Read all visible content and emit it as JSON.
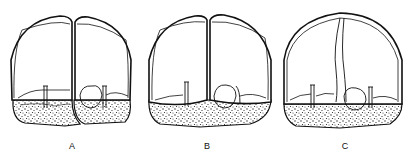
{
  "figure": {
    "panels": [
      {
        "id": "A",
        "label": "A",
        "label_x": 72,
        "label_y": 141
      },
      {
        "id": "B",
        "label": "B",
        "label_x": 207,
        "label_y": 141
      },
      {
        "id": "C",
        "label": "C",
        "label_x": 345,
        "label_y": 141
      }
    ]
  },
  "colors": {
    "ink": "#111111",
    "paper": "#ffffff"
  }
}
